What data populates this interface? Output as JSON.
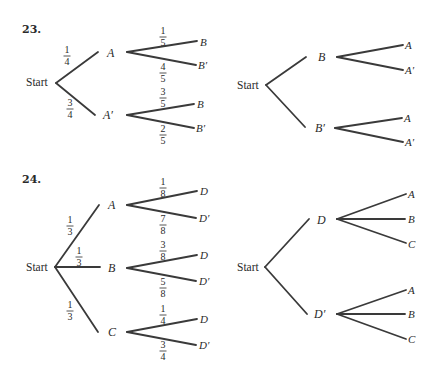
{
  "problems": [
    {
      "number": "23.",
      "left_tree": {
        "root": "Start",
        "level1": [
          {
            "label": "A",
            "prob_num": "1",
            "prob_den": "4",
            "children": [
              {
                "label": "B",
                "prob_num": "1",
                "prob_den": "5"
              },
              {
                "label": "B′",
                "prob_num": "4",
                "prob_den": "5"
              }
            ]
          },
          {
            "label": "A′",
            "prob_num": "3",
            "prob_den": "4",
            "children": [
              {
                "label": "B",
                "prob_num": "3",
                "prob_den": "5"
              },
              {
                "label": "B′",
                "prob_num": "2",
                "prob_den": "5"
              }
            ]
          }
        ]
      },
      "right_tree": {
        "root": "Start",
        "level1": [
          {
            "label": "B",
            "children": [
              {
                "label": "A"
              },
              {
                "label": "A′"
              }
            ]
          },
          {
            "label": "B′",
            "children": [
              {
                "label": "A"
              },
              {
                "label": "A′"
              }
            ]
          }
        ]
      }
    },
    {
      "number": "24.",
      "left_tree": {
        "root": "Start",
        "level1": [
          {
            "label": "A",
            "prob_num": "1",
            "prob_den": "3",
            "children": [
              {
                "label": "D",
                "prob_num": "1",
                "prob_den": "8"
              },
              {
                "label": "D′",
                "prob_num": "7",
                "prob_den": "8"
              }
            ]
          },
          {
            "label": "B",
            "prob_num": "1",
            "prob_den": "3",
            "children": [
              {
                "label": "D",
                "prob_num": "3",
                "prob_den": "8"
              },
              {
                "label": "D′",
                "prob_num": "5",
                "prob_den": "8"
              }
            ]
          },
          {
            "label": "C",
            "prob_num": "1",
            "prob_den": "3",
            "children": [
              {
                "label": "D",
                "prob_num": "1",
                "prob_den": "4"
              },
              {
                "label": "D′",
                "prob_num": "3",
                "prob_den": "4"
              }
            ]
          }
        ]
      },
      "right_tree": {
        "root": "Start",
        "level1": [
          {
            "label": "D",
            "children": [
              {
                "label": "A"
              },
              {
                "label": "B"
              },
              {
                "label": "C"
              }
            ]
          },
          {
            "label": "D′",
            "children": [
              {
                "label": "A"
              },
              {
                "label": "B"
              },
              {
                "label": "C"
              }
            ]
          }
        ]
      }
    }
  ]
}
